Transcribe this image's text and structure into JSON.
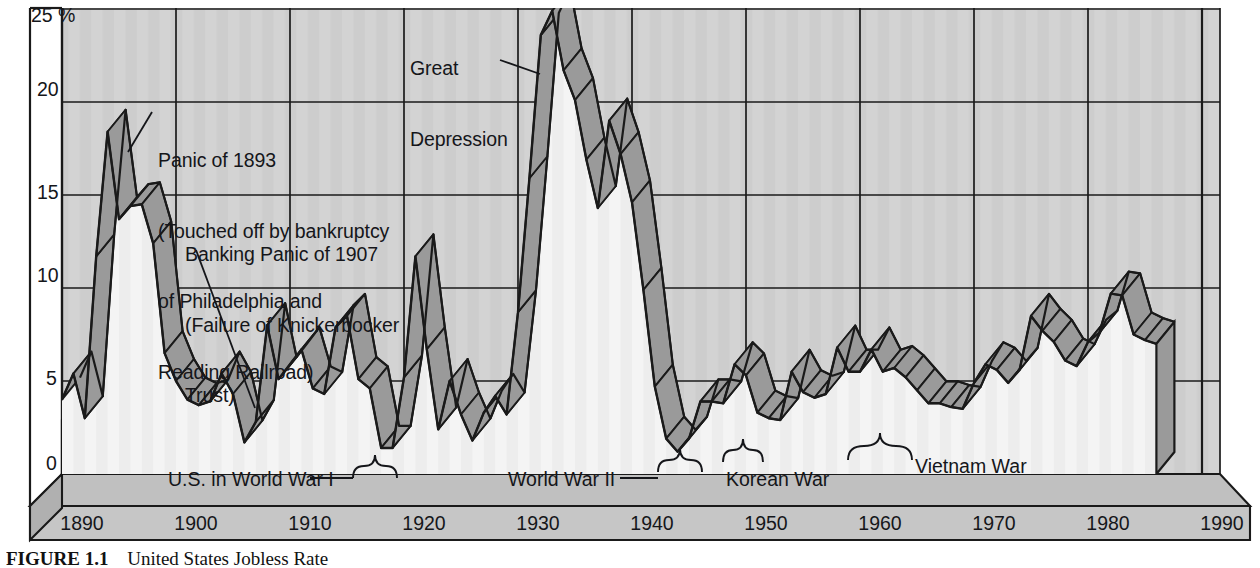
{
  "figure": {
    "caption_prefix": "FIGURE 1.1",
    "caption_text": "United States Jobless Rate",
    "background_color": "#ffffff"
  },
  "colors": {
    "plot_background": "#cfcfcf",
    "band_top_face": "#9a9a9a",
    "band_front_face": "#ededed",
    "grid_line": "#1a1a1a",
    "floor_face": "#c6c6c6",
    "floor_side": "#b4b4b4",
    "stripe_light": "#dcdcdc",
    "stripe_dark": "#c4c4c4",
    "text": "#15161a"
  },
  "annotations": [
    {
      "name": "panic-1893",
      "lines": [
        "Panic of 1893",
        "(Touched off by bankruptcy",
        "of Philadelphia and",
        "Reading Railroad)"
      ],
      "x": 158,
      "y": 104
    },
    {
      "name": "banking-panic-1907",
      "lines": [
        "Banking Panic of 1907",
        "(Failure of Knickerbocker",
        "Trust)"
      ],
      "x": 185,
      "y": 198
    },
    {
      "name": "great-depression",
      "lines": [
        "Great",
        "Depression"
      ],
      "x": 408,
      "y": 10
    }
  ],
  "war_labels": [
    {
      "name": "us-in-world-war-i",
      "text": "U.S. in World War I",
      "x": 168,
      "y": 475
    },
    {
      "name": "world-war-ii",
      "text": "World War II",
      "x": 513,
      "y": 475
    },
    {
      "name": "korean-war",
      "text": "Korean War",
      "x": 731,
      "y": 475
    },
    {
      "name": "vietnam-war",
      "text": "Vietnam War",
      "x": 918,
      "y": 462
    }
  ],
  "chart_data": {
    "type": "area",
    "title": "United States Jobless Rate",
    "xlabel": "",
    "ylabel": "Percent unemployed",
    "xlim": [
      1889,
      1992
    ],
    "ylim": [
      0,
      25
    ],
    "yticks": [
      0,
      5,
      10,
      15,
      20,
      25
    ],
    "ytick_labels": [
      "0",
      "5",
      "10",
      "15",
      "20",
      "25 %"
    ],
    "xticks": [
      1890,
      1900,
      1910,
      1920,
      1930,
      1940,
      1950,
      1960,
      1970,
      1980,
      1990
    ],
    "xtick_labels": [
      "1890",
      "1900",
      "1910",
      "1920",
      "1930",
      "1940",
      "1950",
      "1960",
      "1970",
      "1980",
      "1990"
    ],
    "grid": true,
    "legend": "none",
    "style": "3d-ribbon",
    "x": [
      1890,
      1891,
      1892,
      1893,
      1894,
      1895,
      1896,
      1897,
      1898,
      1899,
      1900,
      1901,
      1902,
      1903,
      1904,
      1905,
      1906,
      1907,
      1908,
      1909,
      1910,
      1911,
      1912,
      1913,
      1914,
      1915,
      1916,
      1917,
      1918,
      1919,
      1920,
      1921,
      1922,
      1923,
      1924,
      1925,
      1926,
      1927,
      1928,
      1929,
      1930,
      1931,
      1932,
      1933,
      1934,
      1935,
      1936,
      1937,
      1938,
      1939,
      1940,
      1941,
      1942,
      1943,
      1944,
      1945,
      1946,
      1947,
      1948,
      1949,
      1950,
      1951,
      1952,
      1953,
      1954,
      1955,
      1956,
      1957,
      1958,
      1959,
      1960,
      1961,
      1962,
      1963,
      1964,
      1965,
      1966,
      1967,
      1968,
      1969,
      1970,
      1971,
      1972,
      1973,
      1974,
      1975,
      1976,
      1977,
      1978,
      1979,
      1980,
      1981,
      1982,
      1983,
      1984,
      1985,
      1986
    ],
    "values": [
      4.0,
      5.4,
      3.0,
      11.7,
      18.4,
      13.7,
      14.4,
      14.5,
      12.4,
      6.5,
      5.0,
      4.0,
      3.7,
      3.9,
      5.4,
      4.3,
      1.7,
      2.8,
      8.0,
      5.1,
      5.9,
      6.7,
      4.6,
      4.3,
      7.9,
      8.5,
      5.1,
      4.6,
      1.4,
      1.4,
      5.2,
      11.7,
      6.7,
      2.4,
      5.0,
      3.2,
      1.8,
      3.3,
      4.2,
      3.2,
      8.7,
      15.9,
      23.6,
      24.9,
      21.7,
      20.1,
      16.9,
      14.3,
      19.0,
      17.2,
      14.6,
      9.9,
      4.7,
      1.9,
      1.2,
      1.9,
      3.9,
      3.9,
      3.8,
      5.9,
      5.3,
      3.3,
      3.0,
      2.9,
      5.5,
      4.4,
      4.1,
      4.3,
      6.8,
      5.5,
      5.5,
      6.7,
      5.5,
      5.7,
      5.2,
      4.5,
      3.8,
      3.8,
      3.6,
      3.5,
      4.9,
      5.9,
      5.6,
      4.9,
      5.6,
      8.5,
      7.7,
      7.1,
      6.1,
      5.8,
      7.1,
      7.6,
      9.7,
      9.6,
      7.5,
      7.2,
      7.0
    ]
  }
}
